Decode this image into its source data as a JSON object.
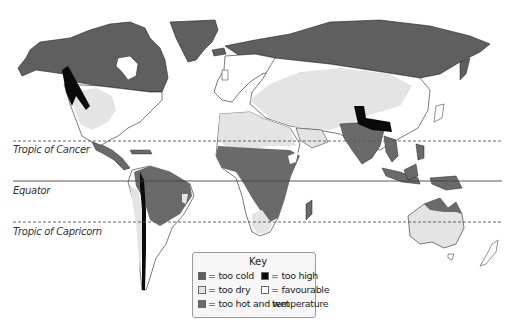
{
  "colors": {
    "too_cold": "#5f5f5f",
    "too_dry": "#e4e4e4",
    "too_hot_and_wet": "#6a6a6a",
    "too_high": "#0a0a0a",
    "favourable": "#ffffff",
    "outline": "#222222"
  },
  "latitude_lines": [
    {
      "name": "Tropic of Cancer",
      "y": 141,
      "style": "dashed"
    },
    {
      "name": "Equator",
      "y": 181,
      "style": "solid"
    },
    {
      "name": "Tropic of Capricorn",
      "y": 222,
      "style": "dashed"
    }
  ],
  "key": {
    "title": "Key",
    "items": [
      {
        "swatch": "too_cold",
        "label": "= too cold"
      },
      {
        "swatch": "too_dry",
        "label": "= too dry"
      },
      {
        "swatch": "too_hot_and_wet",
        "label": "= too hot and wet"
      },
      {
        "swatch": "too_high",
        "label": "= too high"
      },
      {
        "swatch": "favourable",
        "label": "= favourable",
        "label_cont": "temperature"
      }
    ]
  }
}
